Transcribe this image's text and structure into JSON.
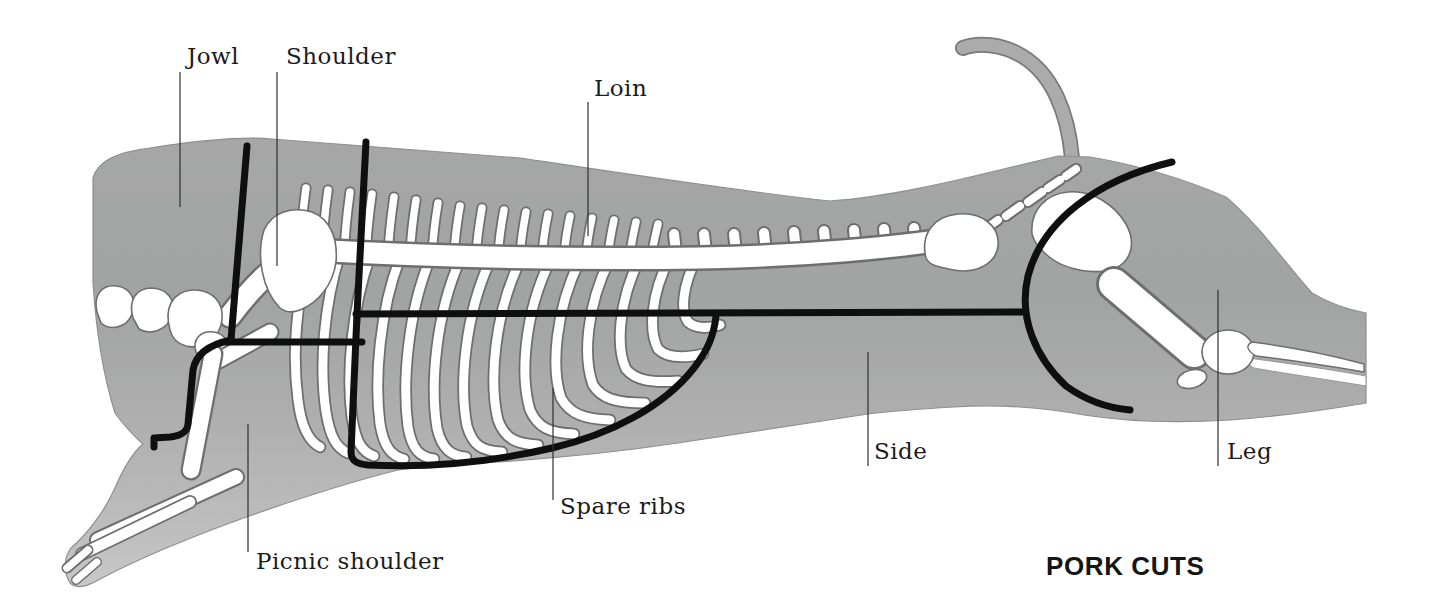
{
  "title": "PORK CUTS",
  "cuts": [
    {
      "id": "jowl",
      "label": "Jowl"
    },
    {
      "id": "shoulder",
      "label": "Shoulder"
    },
    {
      "id": "loin",
      "label": "Loin"
    },
    {
      "id": "spare-ribs",
      "label": "Spare ribs"
    },
    {
      "id": "picnic-shoulder",
      "label": "Picnic shoulder"
    },
    {
      "id": "side",
      "label": "Side"
    },
    {
      "id": "leg",
      "label": "Leg"
    }
  ],
  "colors": {
    "background": "#ffffff",
    "body_gray": "#a9a9a9",
    "body_light": "#c9c9c9",
    "bone_fill": "#ffffff",
    "bone_outline": "#6e6e6e",
    "cut_line": "#0f0f0f",
    "leader_line": "#2f2f2f",
    "label_text": "#1b1b1b",
    "title_text": "#151515"
  }
}
